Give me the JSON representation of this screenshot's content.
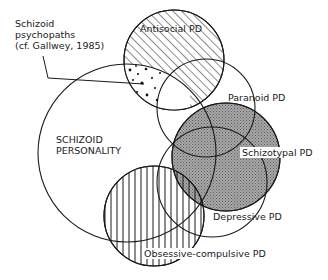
{
  "diagram": {
    "type": "overlapping-circles (Venn-style)",
    "labels": {
      "schizoid_psychopaths": [
        "Schizoid",
        "psychopaths",
        "(cf. Gallwey, 1985)"
      ],
      "schizoid_personality": [
        "SCHIZOID",
        "PERSONALITY"
      ],
      "antisocial": "Antisocial PD",
      "paranoid": "Paranoid PD",
      "schizotypal": "Schizotypal PD",
      "depressive": "Depressive PD",
      "obsessive_compulsive": "Obsessive-compulsive PD"
    },
    "circles": [
      {
        "id": "schizoid",
        "label": "SCHIZOID PERSONALITY",
        "fill": "none"
      },
      {
        "id": "antisocial",
        "label": "Antisocial PD",
        "fill": "diagonal-hatch"
      },
      {
        "id": "paranoid",
        "label": "Paranoid PD",
        "fill": "none"
      },
      {
        "id": "schizotypal",
        "label": "Schizotypal PD",
        "fill": "grey-stipple"
      },
      {
        "id": "depressive",
        "label": "Depressive PD",
        "fill": "none"
      },
      {
        "id": "obsessive_compulsive",
        "label": "Obsessive-compulsive PD",
        "fill": "vertical-hatch"
      }
    ],
    "annotations": [
      {
        "text": "Schizoid psychopaths (cf. Gallwey, 1985)",
        "points_to": "schizoid ∩ antisocial (dotted region)"
      }
    ],
    "colors": {
      "ink": "#1a1a1a",
      "shade": "#9a9a9a",
      "background": "#ffffff"
    }
  }
}
